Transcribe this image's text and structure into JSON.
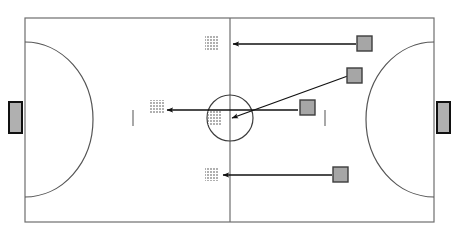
{
  "diagram": {
    "type": "sports-court-diagram",
    "colors": {
      "background": "#ffffff",
      "line": "#6e6e6e",
      "arc_line": "#555555",
      "player_fill": "#a6a6a6",
      "player_stroke": "#3d3d3d",
      "target_fill": "#b3b3b3",
      "arrow": "#111111",
      "goal_fill": "#b0b0b0",
      "goal_stroke": "#111111"
    }
  },
  "court": {
    "name": "court-outline",
    "x": 25,
    "y": 18,
    "width": 409,
    "height": 204,
    "halfway_line_x": 230,
    "center_circle": {
      "cx": 230,
      "cy": 118,
      "r": 23
    },
    "arcs": [
      {
        "name": "penalty-arc-left",
        "side": "left",
        "top_y": 42,
        "bottom_y": 197,
        "depth": 68
      },
      {
        "name": "penalty-arc-right",
        "side": "right",
        "top_y": 42,
        "bottom_y": 197,
        "depth": 68
      }
    ],
    "tick_marks": [
      {
        "name": "second-penalty-mark-left",
        "x": 133,
        "y1": 110,
        "y2": 126
      },
      {
        "name": "second-penalty-mark-right",
        "x": 325,
        "y1": 110,
        "y2": 126
      }
    ]
  },
  "goals": [
    {
      "name": "goal-left",
      "x": 9,
      "y": 102,
      "width": 13,
      "height": 31
    },
    {
      "name": "goal-right",
      "x": 437,
      "y": 102,
      "width": 13,
      "height": 31
    }
  ],
  "players": [
    {
      "name": "player-top-right",
      "id": "P1",
      "x": 357,
      "y": 36,
      "size": 15
    },
    {
      "name": "player-upper-middle",
      "id": "P2",
      "x": 347,
      "y": 68,
      "size": 15
    },
    {
      "name": "player-center-right",
      "id": "P3",
      "x": 300,
      "y": 100,
      "size": 15
    },
    {
      "name": "player-bottom-right",
      "id": "P4",
      "x": 333,
      "y": 167,
      "size": 15
    }
  ],
  "targets": [
    {
      "name": "target-top",
      "id": "T1",
      "x": 205,
      "y": 36,
      "size": 14
    },
    {
      "name": "target-middle-left",
      "id": "T2",
      "x": 150,
      "y": 100,
      "size": 14
    },
    {
      "name": "target-center",
      "id": "T3",
      "x": 208,
      "y": 111,
      "size": 14
    },
    {
      "name": "target-bottom",
      "id": "T4",
      "x": 205,
      "y": 167,
      "size": 14
    }
  ],
  "movement_arrows": [
    {
      "name": "arrow-top-run",
      "from_x": 356,
      "from_y": 44,
      "to_x": 233,
      "to_y": 44
    },
    {
      "name": "arrow-diagonal-pass",
      "from_x": 356,
      "from_y": 73,
      "to_x": 232,
      "to_y": 118
    },
    {
      "name": "arrow-center-run",
      "from_x": 298,
      "from_y": 110,
      "to_x": 167,
      "to_y": 110
    },
    {
      "name": "arrow-bottom-run",
      "from_x": 332,
      "from_y": 175,
      "to_x": 223,
      "to_y": 175
    }
  ]
}
